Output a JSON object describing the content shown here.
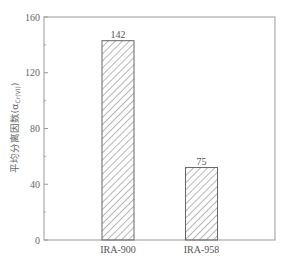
{
  "chart_data": {
    "type": "bar",
    "title": "",
    "xlabel": "",
    "ylabel": "平均分离因数(α",
    "ylabel_subscript": "Cr(VI)",
    "ylabel_close": ")",
    "categories": [
      "IRA-900",
      "IRA-958"
    ],
    "values": [
      142,
      75
    ],
    "data_labels": [
      "142",
      "75"
    ],
    "drawn_bar_heights": [
      143,
      52
    ],
    "ylim": [
      0,
      160
    ],
    "yticks": [
      0,
      40,
      80,
      120,
      160
    ],
    "ytick_labels": [
      "0",
      "40",
      "80",
      "120",
      "160"
    ],
    "minor_yticks": [
      20,
      60,
      100,
      140
    ],
    "grid": false,
    "legend": null,
    "bar_fill": "diagonal-hatch",
    "colors": {
      "axis": "#888888",
      "bar_edge": "#666666",
      "hatch": "#777777",
      "text": "#555555"
    }
  }
}
